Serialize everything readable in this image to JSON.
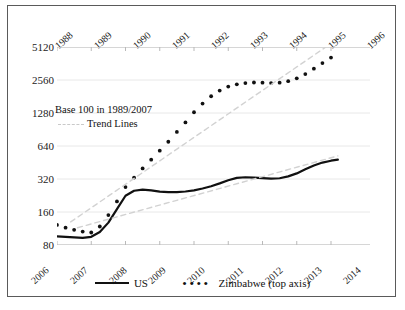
{
  "chart_data": {
    "type": "line",
    "title": "",
    "xlabel": "",
    "ylabel": "",
    "log_scale": true,
    "log_base": 2,
    "ylim": [
      80,
      5120
    ],
    "yticks": [
      80,
      160,
      320,
      640,
      1280,
      2560,
      5120
    ],
    "grid": true,
    "legend_position": "bottom",
    "annotations": [
      "Base 100 in 1989/2007",
      "Trend Lines"
    ],
    "axes": {
      "bottom": {
        "name": "US axis (bottom)",
        "tick_labels": [
          "2006",
          "2007",
          "2008",
          "2009",
          "2010",
          "2011",
          "2012",
          "2013",
          "2014"
        ],
        "rotated": true
      },
      "top": {
        "name": "Zimbabwe axis (top)",
        "tick_labels": [
          "1988",
          "1989",
          "1990",
          "1991",
          "1992",
          "1993",
          "1994",
          "1995",
          "1996"
        ],
        "rotated": true
      }
    },
    "series": [
      {
        "name": "US",
        "style": "solid",
        "color": "#111111",
        "axis": "bottom",
        "x": [
          2006.0,
          2006.25,
          2006.5,
          2006.75,
          2007.0,
          2007.25,
          2007.5,
          2007.75,
          2008.0,
          2008.25,
          2008.5,
          2008.75,
          2009.0,
          2009.25,
          2009.5,
          2009.75,
          2010.0,
          2010.25,
          2010.5,
          2010.75,
          2011.0,
          2011.25,
          2011.5,
          2011.75,
          2012.0,
          2012.25,
          2012.5,
          2012.75,
          2013.0,
          2013.25,
          2013.5,
          2013.75,
          2014.0,
          2014.2
        ],
        "values": [
          96,
          95,
          94,
          93,
          95,
          105,
          128,
          170,
          225,
          250,
          256,
          252,
          245,
          243,
          243,
          246,
          252,
          262,
          275,
          292,
          312,
          328,
          332,
          330,
          326,
          322,
          325,
          338,
          360,
          392,
          425,
          452,
          470,
          480
        ]
      },
      {
        "name": "Zimbabwe (top axis)",
        "style": "dotted",
        "color": "#111111",
        "axis": "top",
        "x": [
          1988.0,
          1988.25,
          1988.5,
          1988.75,
          1989.0,
          1989.25,
          1989.5,
          1989.75,
          1990.0,
          1990.25,
          1990.5,
          1990.75,
          1991.0,
          1991.25,
          1991.5,
          1991.75,
          1992.0,
          1992.25,
          1992.5,
          1992.75,
          1993.0,
          1993.25,
          1993.5,
          1993.75,
          1994.0,
          1994.25,
          1994.5,
          1994.75,
          1995.0,
          1995.25,
          1995.5,
          1995.75,
          1996.0
        ],
        "values": [
          122,
          115,
          110,
          106,
          104,
          118,
          150,
          200,
          270,
          330,
          400,
          480,
          580,
          700,
          860,
          1050,
          1300,
          1560,
          1820,
          2050,
          2230,
          2340,
          2400,
          2430,
          2420,
          2400,
          2420,
          2500,
          2650,
          2900,
          3250,
          3650,
          4100
        ]
      },
      {
        "name": "Trend Line (US)",
        "style": "dashed",
        "color": "#d2d2d2",
        "axis": "bottom",
        "x": [
          2006.6,
          2014.2
        ],
        "values": [
          115,
          520
        ]
      },
      {
        "name": "Trend Line (Zimbabwe)",
        "style": "dashed",
        "color": "#d2d2d2",
        "axis": "top",
        "x": [
          1988.4,
          1995.85
        ],
        "values": [
          130,
          5120
        ]
      }
    ]
  },
  "legend": {
    "us_label": "US",
    "zimbabwe_label": "Zimbabwe (top axis)"
  },
  "annotation": {
    "base_note": "Base 100 in 1989/2007",
    "trend_note": "Trend Lines"
  }
}
